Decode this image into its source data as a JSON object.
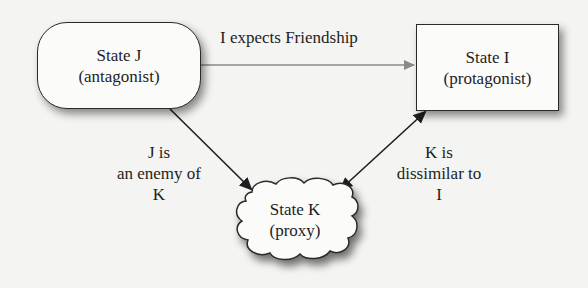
{
  "diagram": {
    "nodes": {
      "state_j": {
        "title": "State J",
        "role": "(antagonist)",
        "shape": "rounded-rectangle"
      },
      "state_i": {
        "title": "State I",
        "role": "(protagonist)",
        "shape": "rectangle"
      },
      "state_k": {
        "title": "State K",
        "role": "(proxy)",
        "shape": "cloud"
      }
    },
    "edges": {
      "j_to_i": {
        "label": "I expects Friendship",
        "from": "State J",
        "to": "State I",
        "style": "gray-single-arrow",
        "color": "#8a8a8a"
      },
      "j_to_k": {
        "label_lines": [
          "J is",
          "an enemy of",
          "K"
        ],
        "from": "State J",
        "to": "State K",
        "style": "black-single-arrow",
        "color": "#1e1e1e"
      },
      "k_i": {
        "label_lines": [
          "K is",
          "dissimilar to",
          "I"
        ],
        "from": "State K",
        "to": "State I",
        "style": "black-double-arrow",
        "color": "#1e1e1e"
      }
    }
  }
}
